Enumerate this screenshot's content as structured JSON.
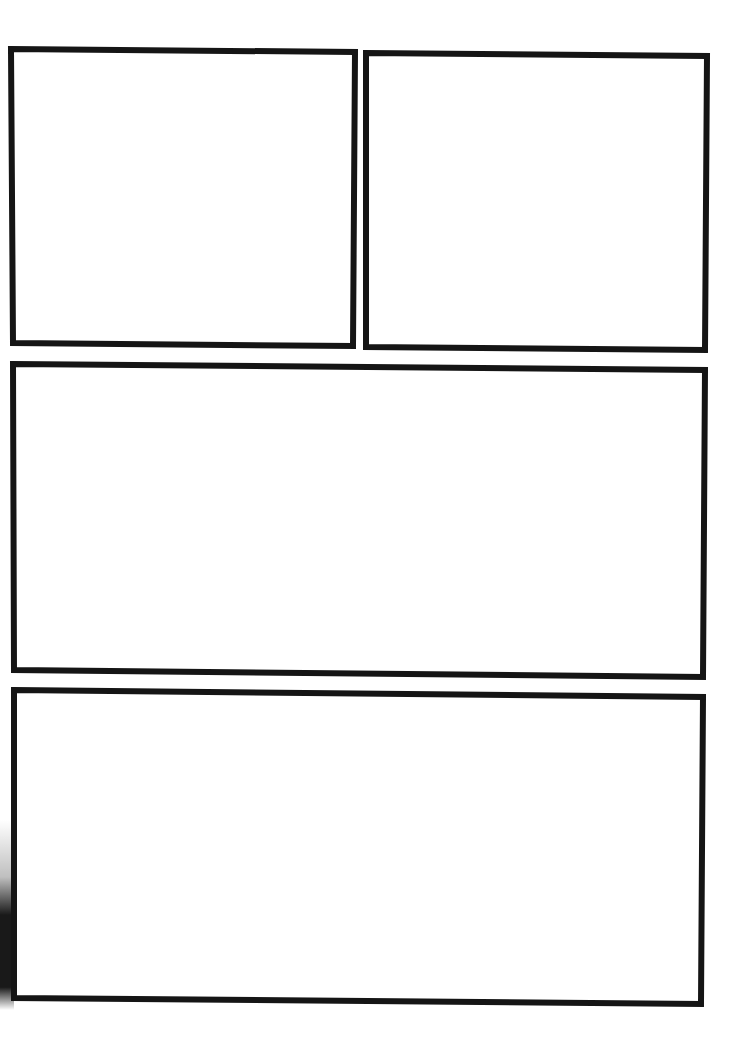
{
  "page": {
    "type": "blank comic panel template",
    "background": "#ffffff",
    "border_color": "#151515",
    "panel_count": 4
  },
  "panels": [
    {
      "id": "panel-1",
      "position": "top-left",
      "content": ""
    },
    {
      "id": "panel-2",
      "position": "top-right",
      "content": ""
    },
    {
      "id": "panel-3",
      "position": "middle-wide",
      "content": ""
    },
    {
      "id": "panel-4",
      "position": "bottom-wide",
      "content": ""
    }
  ]
}
